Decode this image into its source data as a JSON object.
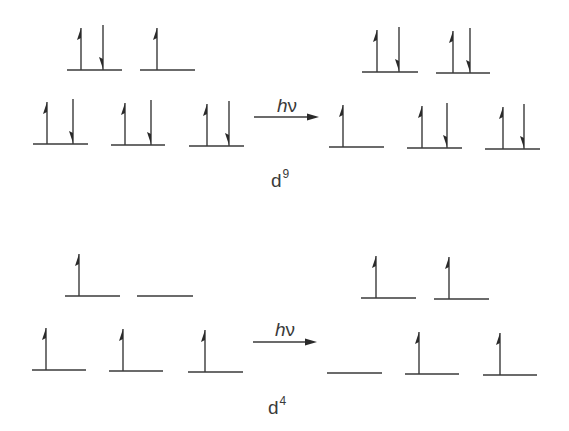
{
  "diagram": {
    "colors": {
      "ink": "#3a3a3a",
      "background": "#ffffff"
    },
    "panels": [
      {
        "id": "d9",
        "config_label": {
          "base": "d",
          "superscript": "9",
          "x": 271,
          "y": 168
        },
        "excitation_label": {
          "h": "h",
          "nu": "ν",
          "cx": 287,
          "y": 96
        },
        "excitation_arrow": {
          "x1": 254,
          "x2": 319,
          "y": 117
        },
        "before": {
          "levels": [
            {
              "x1": 67,
              "x2": 122,
              "y": 70,
              "up_x": 81,
              "down_x": 103
            },
            {
              "x1": 140,
              "x2": 195,
              "y": 70,
              "up_x": 157,
              "down_x": null
            },
            {
              "x1": 33,
              "x2": 88,
              "y": 144,
              "up_x": 47,
              "down_x": 73
            },
            {
              "x1": 111,
              "x2": 165,
              "y": 145,
              "up_x": 125,
              "down_x": 151
            },
            {
              "x1": 189,
              "x2": 244,
              "y": 146,
              "up_x": 207,
              "down_x": 229
            }
          ]
        },
        "after": {
          "levels": [
            {
              "x1": 362,
              "x2": 418,
              "y": 72,
              "up_x": 377,
              "down_x": 399
            },
            {
              "x1": 436,
              "x2": 490,
              "y": 73,
              "up_x": 453,
              "down_x": 470
            },
            {
              "x1": 329,
              "x2": 384,
              "y": 147,
              "up_x": 343,
              "down_x": null
            },
            {
              "x1": 407,
              "x2": 462,
              "y": 148,
              "up_x": 422,
              "down_x": 447
            },
            {
              "x1": 485,
              "x2": 540,
              "y": 149,
              "up_x": 503,
              "down_x": 524
            }
          ]
        }
      },
      {
        "id": "d4",
        "config_label": {
          "base": "d",
          "superscript": "4",
          "x": 268,
          "y": 395
        },
        "excitation_label": {
          "h": "h",
          "nu": "ν",
          "cx": 285,
          "y": 320
        },
        "excitation_arrow": {
          "x1": 253,
          "x2": 317,
          "y": 342
        },
        "before": {
          "levels": [
            {
              "x1": 65,
              "x2": 120,
              "y": 296,
              "up_x": 79,
              "down_x": null
            },
            {
              "x1": 137,
              "x2": 193,
              "y": 296,
              "up_x": null,
              "down_x": null
            },
            {
              "x1": 32,
              "x2": 86,
              "y": 370,
              "up_x": 46,
              "down_x": null
            },
            {
              "x1": 109,
              "x2": 163,
              "y": 371,
              "up_x": 123,
              "down_x": null
            },
            {
              "x1": 188,
              "x2": 243,
              "y": 372,
              "up_x": 205,
              "down_x": null
            }
          ]
        },
        "after": {
          "levels": [
            {
              "x1": 361,
              "x2": 416,
              "y": 298,
              "up_x": 376,
              "down_x": null
            },
            {
              "x1": 434,
              "x2": 489,
              "y": 299,
              "up_x": 449,
              "down_x": null
            },
            {
              "x1": 327,
              "x2": 382,
              "y": 373,
              "up_x": null,
              "down_x": null
            },
            {
              "x1": 405,
              "x2": 459,
              "y": 374,
              "up_x": 419,
              "down_x": null
            },
            {
              "x1": 483,
              "x2": 537,
              "y": 375,
              "up_x": 500,
              "down_x": null
            }
          ]
        }
      }
    ],
    "spin_arrow_length": 42
  },
  "labels": {
    "d9_base": "d",
    "d9_sup": "9",
    "d4_base": "d",
    "d4_sup": "4",
    "hv_h": "h",
    "hv_nu": "ν"
  }
}
